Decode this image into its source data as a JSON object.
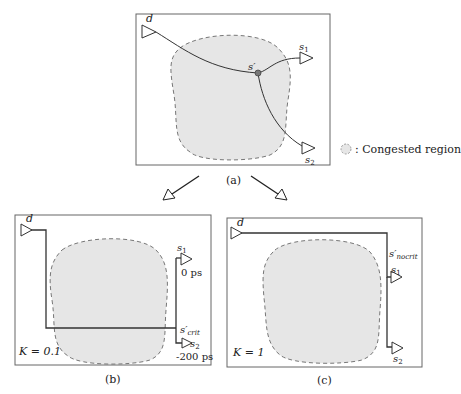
{
  "panels": {
    "a": {
      "caption": "(a)",
      "driver_label": "d",
      "sink1_label": "s",
      "sink1_sub": "1",
      "sink2_label": "s",
      "sink2_sub": "2",
      "steiner_label": "s′"
    },
    "b": {
      "caption": "(b)",
      "driver_label": "d",
      "sink1_label": "s",
      "sink1_sub": "1",
      "sink2_label": "s",
      "sink2_sub": "2",
      "steiner_label": "s′",
      "steiner_sub": "crit",
      "sink1_slack": "0 ps",
      "sink2_slack": "-200 ps",
      "k_value": "K = 0.1"
    },
    "c": {
      "caption": "(c)",
      "driver_label": "d",
      "sink1_label": "s",
      "sink1_sub": "1",
      "sink2_label": "s",
      "sink2_sub": "2",
      "steiner_label": "s′",
      "steiner_sub": "nocrit",
      "k_value": "K = 1"
    }
  },
  "legend": {
    "text": ": Congested region"
  },
  "colors": {
    "congested_fill": "#e6e6e6",
    "wire": "#333333",
    "steiner_point": "#777777"
  }
}
